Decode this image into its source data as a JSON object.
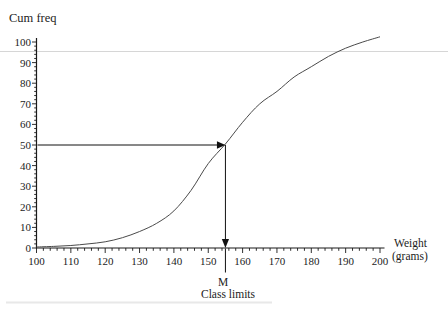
{
  "chart_data": {
    "type": "line",
    "title": "",
    "ylabel": "Cum freq",
    "xlabel_line1": "Weight",
    "xlabel_line2": "(grams)",
    "x_caption": "Class limits",
    "xlim": [
      100,
      200
    ],
    "ylim": [
      0,
      100
    ],
    "x_ticks": [
      100,
      110,
      120,
      130,
      140,
      150,
      160,
      170,
      180,
      190,
      200
    ],
    "y_ticks": [
      0,
      10,
      20,
      30,
      40,
      50,
      60,
      70,
      80,
      90,
      100
    ],
    "minor_tick_step": 2,
    "curve_points": [
      [
        100,
        0.5
      ],
      [
        105,
        0.8
      ],
      [
        110,
        1.2
      ],
      [
        115,
        2
      ],
      [
        120,
        3
      ],
      [
        125,
        5
      ],
      [
        130,
        8
      ],
      [
        135,
        12
      ],
      [
        140,
        18
      ],
      [
        145,
        28
      ],
      [
        150,
        41
      ],
      [
        155,
        50.5
      ],
      [
        160,
        61
      ],
      [
        165,
        70
      ],
      [
        170,
        76
      ],
      [
        175,
        83
      ],
      [
        180,
        88
      ],
      [
        185,
        93
      ],
      [
        190,
        97
      ],
      [
        195,
        100
      ],
      [
        200,
        102.5
      ]
    ],
    "median": {
      "label": "M",
      "weight": 155,
      "cum_freq": 50
    },
    "legend": "none",
    "grid": "off",
    "line_color": "#4a4a4a",
    "axis_color": "#1a1a1a",
    "annotation_color": "#111111",
    "artifact_line_color": "#d6d6d6"
  }
}
